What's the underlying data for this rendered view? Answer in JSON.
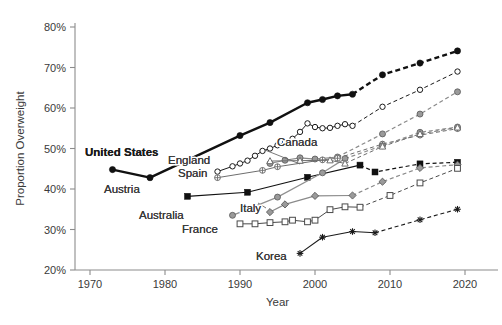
{
  "chart_data": {
    "type": "line",
    "title": "",
    "xlabel": "Year",
    "ylabel": "Proportion Overweight",
    "xlim": [
      1968,
      2022
    ],
    "ylim": [
      20,
      80
    ],
    "xticks": [
      1970,
      1980,
      1990,
      2000,
      2010,
      2020
    ],
    "yticks": [
      20,
      30,
      40,
      50,
      60,
      70,
      80
    ],
    "xtick_labels": [
      "1970",
      "1980",
      "1990",
      "2000",
      "2010",
      "2020"
    ],
    "ytick_labels": [
      "20%",
      "30%",
      "40%",
      "50%",
      "60%",
      "70%",
      "80%"
    ],
    "grid": false,
    "legend_position": "inline-labels",
    "note": "Solid line segments are observed data; dashed line segments are projections.",
    "series": [
      {
        "name": "United States",
        "marker": "filled-circle",
        "color": "#111111",
        "line_width": 2.4,
        "label_bold": true,
        "observed": [
          [
            1973,
            44.8
          ],
          [
            1978,
            42.8
          ],
          [
            1990,
            53.2
          ],
          [
            1994,
            56.4
          ],
          [
            1999,
            61.3
          ],
          [
            2001,
            62.1
          ],
          [
            2003,
            63.0
          ],
          [
            2005,
            63.4
          ]
        ],
        "projected": [
          [
            2005,
            63.4
          ],
          [
            2009,
            68.2
          ],
          [
            2014,
            71.1
          ],
          [
            2019,
            74.1
          ]
        ]
      },
      {
        "name": "England",
        "marker": "open-circle",
        "color": "#1a1a1a",
        "line_width": 1.0,
        "label_bold": false,
        "observed": [
          [
            1987,
            44.3
          ],
          [
            1989,
            45.6
          ],
          [
            1990,
            46.3
          ],
          [
            1991,
            47.0
          ],
          [
            1992,
            48.2
          ],
          [
            1993,
            49.4
          ],
          [
            1994,
            50.0
          ],
          [
            1995,
            50.8
          ],
          [
            1996,
            51.6
          ],
          [
            1997,
            52.4
          ],
          [
            1998,
            54.1
          ],
          [
            1999,
            56.2
          ],
          [
            2000,
            55.3
          ],
          [
            2001,
            55.0
          ],
          [
            2002,
            55.1
          ],
          [
            2003,
            55.6
          ],
          [
            2004,
            56.0
          ],
          [
            2005,
            55.6
          ]
        ],
        "projected": [
          [
            2005,
            55.6
          ],
          [
            2009,
            60.3
          ],
          [
            2014,
            64.5
          ],
          [
            2019,
            69.0
          ]
        ]
      },
      {
        "name": "Canada",
        "marker": "gray-circle",
        "color": "#8a8a8a",
        "line_width": 1.2,
        "label_bold": false,
        "observed": [
          [
            1994,
            46.3
          ],
          [
            1996,
            47.1
          ],
          [
            1998,
            47.7
          ],
          [
            2000,
            47.4
          ],
          [
            2003,
            47.9
          ]
        ],
        "projected": [
          [
            2003,
            47.9
          ],
          [
            2009,
            53.6
          ],
          [
            2014,
            58.5
          ],
          [
            2019,
            64.0
          ]
        ]
      },
      {
        "name": "Spain",
        "marker": "circled-plus",
        "color": "#6e6e6e",
        "line_width": 1.0,
        "label_bold": false,
        "observed": [
          [
            1987,
            42.8
          ],
          [
            1993,
            44.6
          ],
          [
            1995,
            45.5
          ],
          [
            2001,
            47.2
          ],
          [
            2003,
            47.6
          ]
        ],
        "projected": [
          [
            2003,
            47.6
          ],
          [
            2009,
            51.1
          ],
          [
            2014,
            53.3
          ],
          [
            2019,
            54.9
          ]
        ]
      },
      {
        "name": "Austria",
        "marker": "filled-square",
        "color": "#111111",
        "line_width": 1.2,
        "label_bold": false,
        "observed": [
          [
            1983,
            38.2
          ],
          [
            1991,
            39.2
          ],
          [
            1999,
            42.9
          ],
          [
            2006,
            45.9
          ]
        ],
        "projected": [
          [
            2006,
            45.9
          ],
          [
            2008,
            44.2
          ],
          [
            2014,
            46.2
          ],
          [
            2019,
            46.6
          ]
        ]
      },
      {
        "name": "Australia",
        "marker": "gray-circle",
        "color": "#909090",
        "line_width": 1.2,
        "label_bold": false,
        "observed": [
          [
            1989,
            33.5
          ],
          [
            1995,
            38.0
          ],
          [
            2001,
            44.0
          ],
          [
            2004,
            47.5
          ]
        ],
        "projected": [
          [
            2004,
            47.5
          ],
          [
            2009,
            50.7
          ],
          [
            2014,
            54.0
          ],
          [
            2019,
            55.3
          ]
        ]
      },
      {
        "name": "Italy",
        "marker": "gray-diamond",
        "color": "#8a8a8a",
        "line_width": 1.2,
        "label_bold": false,
        "observed": [
          [
            1994,
            34.3
          ],
          [
            1996,
            36.2
          ],
          [
            2000,
            38.3
          ],
          [
            2005,
            38.4
          ]
        ],
        "projected": [
          [
            2005,
            38.4
          ],
          [
            2009,
            41.8
          ],
          [
            2014,
            45.2
          ],
          [
            2019,
            46.0
          ]
        ]
      },
      {
        "name": "France",
        "marker": "open-square",
        "color": "#4a4a4a",
        "line_width": 1.0,
        "label_bold": false,
        "observed": [
          [
            1990,
            31.4
          ],
          [
            1992,
            31.4
          ],
          [
            1994,
            31.7
          ],
          [
            1996,
            31.9
          ],
          [
            1997,
            32.3
          ],
          [
            1999,
            31.9
          ],
          [
            2000,
            32.3
          ],
          [
            2002,
            34.9
          ],
          [
            2004,
            35.6
          ],
          [
            2006,
            35.5
          ]
        ],
        "projected": [
          [
            2006,
            35.5
          ],
          [
            2010,
            38.4
          ],
          [
            2014,
            41.5
          ],
          [
            2019,
            45.1
          ]
        ]
      },
      {
        "name": "Korea",
        "marker": "asterisk",
        "color": "#1a1a1a",
        "line_width": 1.1,
        "label_bold": false,
        "observed": [
          [
            1998,
            24.1
          ],
          [
            2001,
            28.1
          ],
          [
            2005,
            29.5
          ],
          [
            2008,
            29.2
          ]
        ],
        "projected": [
          [
            2008,
            29.2
          ],
          [
            2014,
            32.4
          ],
          [
            2019,
            35.0
          ]
        ]
      },
      {
        "name": "Netherlands",
        "marker": "open-triangle",
        "color": "#6e6e6e",
        "line_width": 1.0,
        "label_bold": false,
        "observed": [
          [
            1994,
            46.9
          ],
          [
            1998,
            47.0
          ],
          [
            2002,
            47.1
          ],
          [
            2004,
            46.3
          ]
        ],
        "projected": [
          [
            2004,
            46.3
          ],
          [
            2009,
            50.5
          ],
          [
            2014,
            53.6
          ],
          [
            2019,
            55.2
          ]
        ]
      }
    ],
    "inline_labels": [
      {
        "text": "United States",
        "x": 85,
        "y": 156,
        "bold": true,
        "anchor": "start"
      },
      {
        "text": "England",
        "x": 168,
        "y": 164,
        "bold": false,
        "anchor": "start"
      },
      {
        "text": "Canada",
        "x": 277,
        "y": 146,
        "bold": false,
        "anchor": "start"
      },
      {
        "text": "Spain",
        "x": 178,
        "y": 177,
        "bold": false,
        "anchor": "start"
      },
      {
        "text": "Austria",
        "x": 104,
        "y": 193,
        "bold": false,
        "anchor": "start"
      },
      {
        "text": "Australia",
        "x": 139,
        "y": 219,
        "bold": false,
        "anchor": "start"
      },
      {
        "text": "Italy",
        "x": 240,
        "y": 212,
        "bold": false,
        "anchor": "start"
      },
      {
        "text": "France",
        "x": 182,
        "y": 233,
        "bold": false,
        "anchor": "start"
      },
      {
        "text": "Korea",
        "x": 256,
        "y": 260,
        "bold": false,
        "anchor": "start"
      }
    ],
    "leader_lines": [
      {
        "from": [
          265,
          150
        ],
        "to": [
          300,
          164
        ]
      },
      {
        "from": [
          266,
          208
        ],
        "to": [
          258,
          203
        ]
      }
    ]
  },
  "caption": {
    "text": ""
  }
}
